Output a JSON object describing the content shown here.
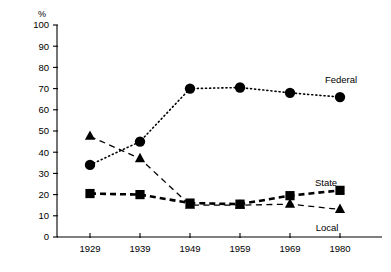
{
  "chart_data": {
    "type": "line",
    "title": "",
    "subtitle": "",
    "xlabel": "",
    "ylabel": "%",
    "categories": [
      "1929",
      "1939",
      "1949",
      "1959",
      "1969",
      "1980"
    ],
    "x_tick_labels": [
      "1929",
      "1939",
      "1949",
      "1959",
      "1969",
      "1980"
    ],
    "y_tick_labels": [
      "0",
      "10",
      "20",
      "30",
      "40",
      "50",
      "60",
      "70",
      "80",
      "90",
      "100"
    ],
    "y_ticks": [
      0,
      10,
      20,
      30,
      40,
      50,
      60,
      70,
      80,
      90,
      100
    ],
    "ylim": [
      0,
      100
    ],
    "grid": false,
    "legend_position": "inline-right-of-series",
    "series": [
      {
        "name": "Federal",
        "marker": "circle",
        "line_style": "dotted",
        "color": "#000000",
        "values": [
          34,
          45,
          70,
          70.5,
          68,
          66
        ],
        "label": "Federal"
      },
      {
        "name": "State",
        "marker": "square",
        "line_style": "dashed-thick",
        "color": "#000000",
        "values": [
          20.5,
          20,
          16,
          15.5,
          19.5,
          22
        ],
        "label": "State"
      },
      {
        "name": "Local",
        "marker": "triangle",
        "line_style": "dashed-thin",
        "color": "#000000",
        "values": [
          47.5,
          37,
          15,
          15,
          15.5,
          13
        ],
        "label": "Local"
      }
    ],
    "annotations": [
      {
        "text": "Federal",
        "x": 1980,
        "y": 74
      },
      {
        "text": "State",
        "x": 1976,
        "y": 26
      },
      {
        "text": "Local",
        "x": 1976,
        "y": 9
      }
    ]
  },
  "axis": {
    "unit_label": "%"
  }
}
